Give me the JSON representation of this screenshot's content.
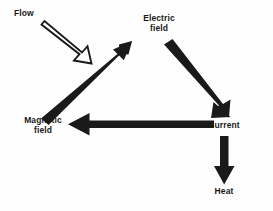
{
  "diagram": {
    "type": "cycle-diagram",
    "background_color": "#fefefe",
    "arrow_color": "#1a1a1a",
    "label_color": "#1a1a1a",
    "nodes": [
      {
        "id": "flow",
        "label": "Flow",
        "lines": [
          "Flow"
        ],
        "x": 30,
        "y": 16
      },
      {
        "id": "electric-field",
        "label": "Electric field",
        "lines": [
          "Electric",
          "field"
        ],
        "x": 159,
        "y": 24
      },
      {
        "id": "magnetic-field",
        "label": "Magnetic field",
        "lines": [
          "Magnetic",
          "field"
        ],
        "x": 43,
        "y": 126
      },
      {
        "id": "current",
        "label": "Current",
        "lines": [
          "Current"
        ],
        "x": 224,
        "y": 126
      },
      {
        "id": "heat",
        "label": "Heat",
        "lines": [
          "Heat"
        ],
        "x": 224,
        "y": 192
      }
    ],
    "arrows": [
      {
        "id": "flow-to-cycle",
        "from": "flow",
        "to": "cycle",
        "style": "hollow",
        "direction": "down-right",
        "fill": "#ffffff",
        "stroke": "#1a1a1a"
      },
      {
        "id": "magnetic-to-electric",
        "from": "magnetic-field",
        "to": "electric-field",
        "style": "solid",
        "direction": "up-right",
        "fill": "#1a1a1a"
      },
      {
        "id": "electric-to-current",
        "from": "electric-field",
        "to": "current",
        "style": "solid",
        "direction": "down-right",
        "fill": "#1a1a1a"
      },
      {
        "id": "current-to-magnetic",
        "from": "current",
        "to": "magnetic-field",
        "style": "solid",
        "direction": "left",
        "fill": "#1a1a1a"
      },
      {
        "id": "current-to-heat",
        "from": "current",
        "to": "heat",
        "style": "solid",
        "direction": "down",
        "fill": "#1a1a1a"
      }
    ]
  }
}
